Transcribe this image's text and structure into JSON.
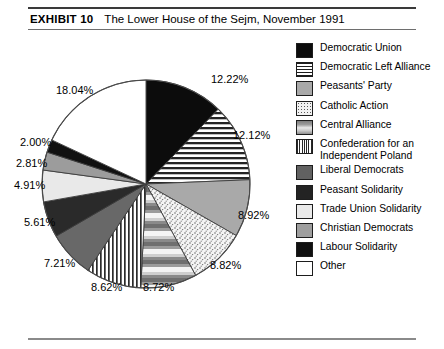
{
  "header": {
    "exhibit_label": "EXHIBIT 10",
    "title": "The Lower House of the Sejm, November 1991"
  },
  "chart_data": {
    "type": "pie",
    "title": "The Lower House of the Sejm, November 1991",
    "units": "percent",
    "start_angle_deg": 0,
    "direction": "clockwise",
    "legend_position": "right",
    "categories": [
      "Democratic Union",
      "Democratic Left Alliance",
      "Peasants' Party",
      "Catholic Action",
      "Central Alliance",
      "Confederation for an Independent Poland",
      "Liberal Democrats",
      "Peasant Solidarity",
      "Trade Union Solidarity",
      "Christian Democrats",
      "Labour Solidarity",
      "Other"
    ],
    "values": [
      12.22,
      12.12,
      8.92,
      8.82,
      8.72,
      8.62,
      7.21,
      5.61,
      4.91,
      2.81,
      2.0,
      18.04
    ],
    "value_labels": [
      "12.22%",
      "12.12%",
      "8.92%",
      "8.82%",
      "8.72%",
      "8.62%",
      "7.21%",
      "5.61%",
      "4.91%",
      "2.81%",
      "2.00%",
      "18.04%"
    ],
    "slice_patterns": [
      "solid-black",
      "horizontal-stripes",
      "medium-gray",
      "fine-dots",
      "horizontal-gradient-bands",
      "vertical-stripes",
      "dark-gray",
      "very-dark-gray",
      "very-light-gray",
      "gray",
      "black",
      "white"
    ]
  },
  "legend": {
    "items": [
      {
        "label": "Democratic Union",
        "swatch": "solid-black",
        "pct": "12.22%"
      },
      {
        "label": "Democratic Left Alliance",
        "swatch": "horizontal-stripes",
        "pct": "12.12%"
      },
      {
        "label": "Peasants' Party",
        "swatch": "medium-gray",
        "pct": "8.92%"
      },
      {
        "label": "Catholic Action",
        "swatch": "fine-dots",
        "pct": "8.82%"
      },
      {
        "label": "Central Alliance",
        "swatch": "horizontal-gradient-bands",
        "pct": "8.72%"
      },
      {
        "label": "Confederation for an Independent Poland",
        "swatch": "vertical-stripes",
        "pct": "8.62%"
      },
      {
        "label": "Liberal Democrats",
        "swatch": "dark-gray",
        "pct": "7.21%"
      },
      {
        "label": "Peasant Solidarity",
        "swatch": "very-dark-gray",
        "pct": "5.61%"
      },
      {
        "label": "Trade Union Solidarity",
        "swatch": "very-light-gray",
        "pct": "4.91%"
      },
      {
        "label": "Christian Democrats",
        "swatch": "gray",
        "pct": "2.81%"
      },
      {
        "label": "Labour Solidarity",
        "swatch": "black",
        "pct": "2.00%"
      },
      {
        "label": "Other",
        "swatch": "white",
        "pct": "18.04%"
      }
    ]
  },
  "pie_labels": [
    {
      "text": "12.22%",
      "left": 211,
      "top": 73
    },
    {
      "text": "12.12%",
      "left": 233,
      "top": 129
    },
    {
      "text": "8.92%",
      "left": 238,
      "top": 209
    },
    {
      "text": "8.82%",
      "left": 210,
      "top": 259
    },
    {
      "text": "8.72%",
      "left": 143,
      "top": 281
    },
    {
      "text": "8.62%",
      "left": 91,
      "top": 281
    },
    {
      "text": "7.21%",
      "left": 44,
      "top": 257
    },
    {
      "text": "5.61%",
      "left": 24,
      "top": 216
    },
    {
      "text": "4.91%",
      "left": 14,
      "top": 179
    },
    {
      "text": "2.81%",
      "left": 16,
      "top": 157
    },
    {
      "text": "2.00%",
      "left": 20,
      "top": 136
    },
    {
      "text": "18.04%",
      "left": 56,
      "top": 84
    }
  ]
}
